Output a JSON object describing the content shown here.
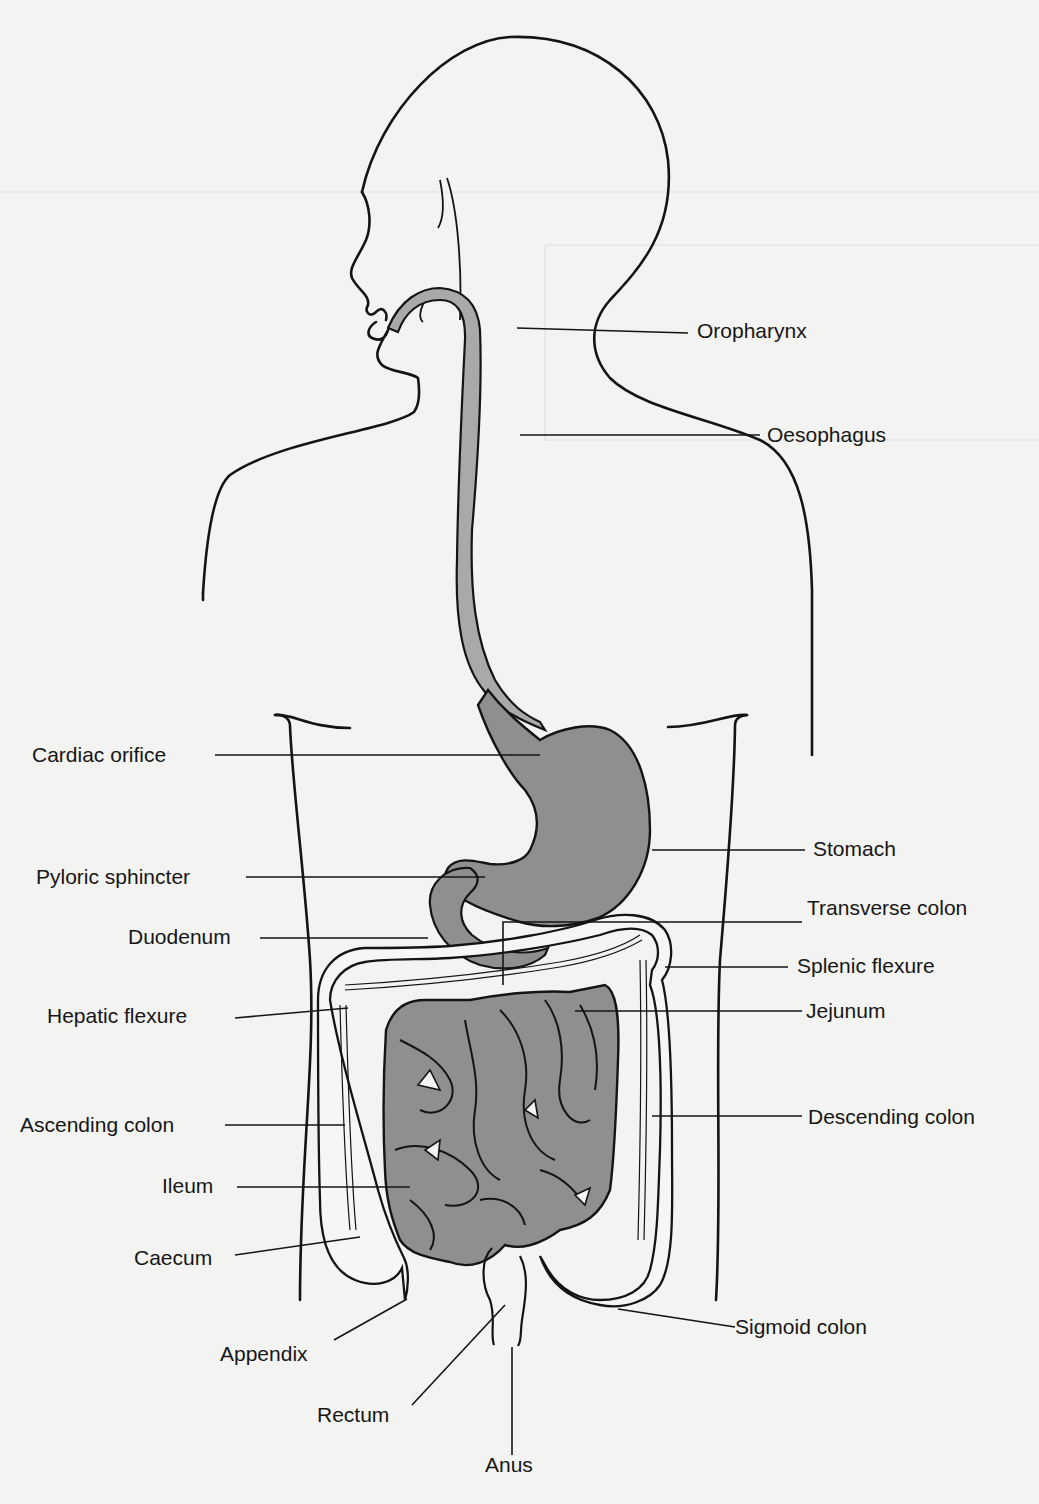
{
  "figure": {
    "colors": {
      "background": "#f3f3f1",
      "outline": "#141414",
      "organ_fill": "#8f8f8f",
      "oesophagus_fill": "#a8a8a8",
      "colon_fill": "#f6f6f4"
    }
  },
  "labels": {
    "oropharynx": "Oropharynx",
    "oesophagus": "Oesophagus",
    "cardiac_orifice": "Cardiac orifice",
    "stomach": "Stomach",
    "pyloric_sphincter": "Pyloric sphincter",
    "transverse_colon": "Transverse colon",
    "duodenum": "Duodenum",
    "splenic_flexure": "Splenic flexure",
    "hepatic_flexure": "Hepatic flexure",
    "jejunum": "Jejunum",
    "ascending_colon": "Ascending colon",
    "descending_colon": "Descending colon",
    "ileum": "Ileum",
    "caecum": "Caecum",
    "sigmoid_colon": "Sigmoid colon",
    "appendix": "Appendix",
    "rectum": "Rectum",
    "anus": "Anus"
  }
}
